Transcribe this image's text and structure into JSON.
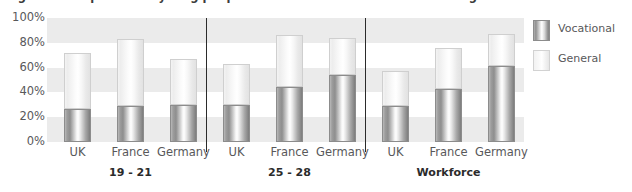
{
  "title_remnant": "Figure 3: Proportion of young people and workforce with vocational or general qualifications",
  "legend": {
    "position": "right",
    "items": [
      {
        "label": "Vocational",
        "color": "#8e8e8e",
        "key": "vocational"
      },
      {
        "label": "General",
        "color": "#f0f0f0",
        "key": "general"
      }
    ]
  },
  "axis": {
    "ticks": [
      "100%",
      "80%",
      "60%",
      "40%",
      "20%",
      "0%"
    ],
    "tick_values": [
      100,
      80,
      60,
      40,
      20,
      0
    ],
    "min": 0,
    "max": 100
  },
  "groups": [
    {
      "label": "19 - 21",
      "categories": [
        "UK",
        "France",
        "Germany"
      ]
    },
    {
      "label": "25 - 28",
      "categories": [
        "UK",
        "France",
        "Germany"
      ]
    },
    {
      "label": "Workforce",
      "categories": [
        "UK",
        "France",
        "Germany"
      ]
    }
  ],
  "chart_data": {
    "type": "bar",
    "subtype": "stacked-column",
    "title": "Figure 3: Proportion of young people and workforce with vocational or general qualifications",
    "xlabel": "",
    "ylabel": "",
    "ylim": [
      0,
      100
    ],
    "ytick_labels": [
      "0%",
      "20%",
      "40%",
      "60%",
      "80%",
      "100%"
    ],
    "grid": "horizontal-bands",
    "legend_position": "right",
    "group_labels": [
      "19 - 21",
      "25 - 28",
      "Workforce"
    ],
    "categories": [
      "19 - 21 / UK",
      "19 - 21 / France",
      "19 - 21 / Germany",
      "25 - 28 / UK",
      "25 - 28 / France",
      "25 - 28 / Germany",
      "Workforce / UK",
      "Workforce / France",
      "Workforce / Germany"
    ],
    "series": [
      {
        "name": "Vocational",
        "color": "#8e8e8e",
        "values": [
          27,
          29,
          30,
          30,
          44,
          54,
          29,
          43,
          61
        ]
      },
      {
        "name": "General",
        "color": "#f0f0f0",
        "values": [
          45,
          54,
          37,
          33,
          42,
          30,
          28,
          33,
          26
        ]
      }
    ],
    "totals": [
      72,
      83,
      67,
      63,
      86,
      84,
      57,
      76,
      87
    ]
  },
  "bars": [
    {
      "group": 0,
      "category": "UK",
      "vocational": 27,
      "general": 45,
      "total": 72
    },
    {
      "group": 0,
      "category": "France",
      "vocational": 29,
      "general": 54,
      "total": 83
    },
    {
      "group": 0,
      "category": "Germany",
      "vocational": 30,
      "general": 37,
      "total": 67
    },
    {
      "group": 1,
      "category": "UK",
      "vocational": 30,
      "general": 33,
      "total": 63
    },
    {
      "group": 1,
      "category": "France",
      "vocational": 44,
      "general": 42,
      "total": 86
    },
    {
      "group": 1,
      "category": "Germany",
      "vocational": 54,
      "general": 30,
      "total": 84
    },
    {
      "group": 2,
      "category": "UK",
      "vocational": 29,
      "general": 28,
      "total": 57
    },
    {
      "group": 2,
      "category": "France",
      "vocational": 43,
      "general": 33,
      "total": 76
    },
    {
      "group": 2,
      "category": "Germany",
      "vocational": 61,
      "general": 26,
      "total": 87
    }
  ]
}
